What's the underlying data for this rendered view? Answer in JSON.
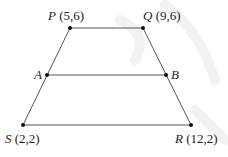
{
  "diagram": {
    "type": "trapezoid",
    "points": [
      {
        "id": "P",
        "name": "P",
        "coords": "(5,6)",
        "x": 70,
        "y": 28
      },
      {
        "id": "Q",
        "name": "Q",
        "coords": "(9,6)",
        "x": 143,
        "y": 28
      },
      {
        "id": "A",
        "name": "A",
        "coords": "",
        "x": 47,
        "y": 75
      },
      {
        "id": "B",
        "name": "B",
        "coords": "",
        "x": 166,
        "y": 75
      },
      {
        "id": "S",
        "name": "S",
        "coords": "(2,2)",
        "x": 23,
        "y": 125
      },
      {
        "id": "R",
        "name": "R",
        "coords": "(12,2)",
        "x": 191,
        "y": 125
      }
    ],
    "segments": [
      {
        "from": "P",
        "to": "Q"
      },
      {
        "from": "A",
        "to": "B"
      },
      {
        "from": "S",
        "to": "R"
      },
      {
        "from": "P",
        "to": "S"
      },
      {
        "from": "Q",
        "to": "R"
      }
    ],
    "labels": {
      "P": {
        "name": "P",
        "coords": "(5,6)"
      },
      "Q": {
        "name": "Q",
        "coords": "(9,6)"
      },
      "A": {
        "name": "A"
      },
      "B": {
        "name": "B"
      },
      "S": {
        "name": "S",
        "coords": "(2,2)"
      },
      "R": {
        "name": "R",
        "coords": "(12,2)"
      }
    },
    "colors": {
      "line": "#555555",
      "point": "#111111",
      "watermark": "#f1f1f1"
    }
  }
}
